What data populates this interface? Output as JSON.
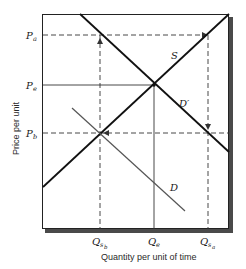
{
  "diagram": {
    "y_axis_title": "Price per unit",
    "x_axis_title": "Quantity per unit of time",
    "price_labels": [
      {
        "main": "P",
        "sub": "a"
      },
      {
        "main": "P",
        "sub": "e"
      },
      {
        "main": "P",
        "sub": "b"
      }
    ],
    "quantity_labels": [
      {
        "main": "Q",
        "sub": "s",
        "subsub": "b"
      },
      {
        "main": "Q",
        "sub": "e",
        "subsub": ""
      },
      {
        "main": "Q",
        "sub": "s",
        "subsub": "a"
      }
    ],
    "curves": {
      "supply": "S",
      "demand": "D",
      "demand_shifted": "D′"
    }
  }
}
